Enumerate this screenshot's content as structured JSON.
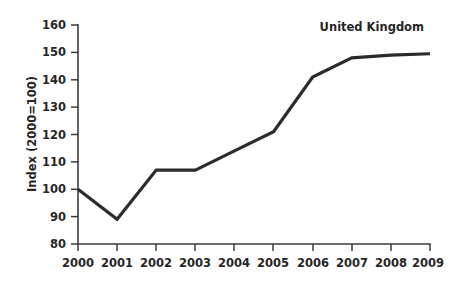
{
  "chart_data": {
    "type": "line",
    "title": "United Kingdom",
    "xlabel": "",
    "ylabel": "Index (2000=100)",
    "x": [
      2000,
      2001,
      2002,
      2003,
      2004,
      2005,
      2006,
      2007,
      2008,
      2009
    ],
    "categories": [
      "2000",
      "2001",
      "2002",
      "2003",
      "2004",
      "2005",
      "2006",
      "2007",
      "2008",
      "2009"
    ],
    "series": [
      {
        "name": "United Kingdom",
        "values": [
          100,
          89,
          107,
          107,
          114,
          121,
          141,
          148,
          149,
          149.5
        ],
        "color": "#2b2b2b"
      }
    ],
    "values": [
      100,
      89,
      107,
      107,
      114,
      121,
      141,
      148,
      149,
      149.5
    ],
    "ylim": [
      80,
      160
    ],
    "xlim": [
      2000,
      2009
    ],
    "yticks": [
      80,
      90,
      100,
      110,
      120,
      130,
      140,
      150,
      160
    ],
    "ytick_labels": [
      "80",
      "90",
      "100",
      "110",
      "120",
      "130",
      "140",
      "150",
      "160"
    ],
    "xtick_labels": [
      "2000",
      "2001",
      "2002",
      "2003",
      "2004",
      "2005",
      "2006",
      "2007",
      "2008",
      "2009"
    ],
    "grid": false,
    "legend": "none",
    "annotations": [
      {
        "text": "United Kingdom",
        "position": "top-right"
      }
    ]
  },
  "axes": {
    "y_axis_title": "Index (2000=100)",
    "x_axis_title": ""
  },
  "colors": {
    "background": "#ffffff",
    "line": "#2b2b2b",
    "axis": "#3b3b3b",
    "text": "#262626"
  }
}
